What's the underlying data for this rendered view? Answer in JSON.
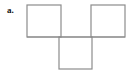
{
  "figure": {
    "label": "a.",
    "kind": "square-net-diagram",
    "canvas": {
      "width": 132,
      "height": 73,
      "background": "#ffffff"
    },
    "stroke": {
      "color": "#8c8c8c",
      "width": 1.2
    },
    "square_size": 34,
    "squares": [
      {
        "name": "top-left-square",
        "x": 27,
        "y": 5,
        "w": 34,
        "h": 32
      },
      {
        "name": "top-right-square",
        "x": 91,
        "y": 5,
        "w": 34,
        "h": 32
      },
      {
        "name": "bottom-middle-square",
        "x": 59,
        "y": 37,
        "w": 33,
        "h": 32
      }
    ],
    "connector": {
      "name": "middle-horizontal-rule",
      "x1": 27,
      "y1": 37,
      "x2": 125,
      "y2": 37
    }
  }
}
